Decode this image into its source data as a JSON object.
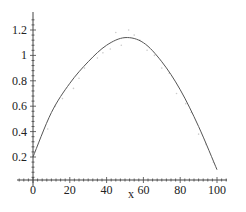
{
  "chart_data": {
    "type": "line",
    "title": "",
    "xlabel": "x",
    "ylabel": "",
    "xlim": [
      -9,
      105
    ],
    "ylim": [
      0.02,
      1.31
    ],
    "x_ticks": [
      0,
      20,
      40,
      60,
      80,
      100
    ],
    "x_tick_labels": [
      "0",
      "20",
      "40",
      "60",
      "80",
      "100"
    ],
    "y_ticks": [
      0.2,
      0.4,
      0.6,
      0.8,
      1.0,
      1.2
    ],
    "y_tick_labels": [
      "0.2",
      "0.4",
      "0.6",
      "0.8",
      "1",
      "1.2"
    ],
    "grid": false,
    "legend": null,
    "series": [
      {
        "name": "fitted curve",
        "style": "line",
        "color": "#555555",
        "x": [
          0,
          10,
          20,
          30,
          40,
          50,
          60,
          70,
          80,
          90,
          100
        ],
        "y": [
          0.2,
          0.55,
          0.78,
          0.95,
          1.08,
          1.14,
          1.1,
          0.95,
          0.73,
          0.44,
          0.1
        ]
      },
      {
        "name": "data points (faint)",
        "style": "scatter",
        "color": "#cccccc",
        "x": [
          8,
          12,
          16,
          22,
          25,
          28,
          35,
          38,
          42,
          45,
          48,
          52,
          55,
          58,
          62,
          66,
          70,
          74,
          78,
          83,
          86,
          90,
          94,
          98
        ],
        "y": [
          0.42,
          0.6,
          0.66,
          0.74,
          0.82,
          0.9,
          0.98,
          1.02,
          1.05,
          1.18,
          1.08,
          1.2,
          1.16,
          1.12,
          1.04,
          1.0,
          0.9,
          0.86,
          0.7,
          0.62,
          0.55,
          0.38,
          0.3,
          0.16
        ]
      }
    ]
  }
}
